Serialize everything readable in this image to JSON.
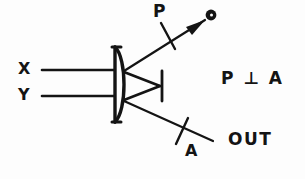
{
  "figure": {
    "background_color": "#fdfdfd",
    "ink_color": "#141414"
  },
  "labels": {
    "input_x": "X",
    "input_y": "Y",
    "polarizer": "P",
    "analyzer": "A",
    "output": "OUT",
    "relation": "P ⊥ A"
  },
  "elements": {
    "device_body_name": "lens-element",
    "detector_dot_name": "detector-dot",
    "arrowhead_name": "beam-arrowhead",
    "terminator_name": "output-terminator-bar",
    "polarizer_tick_name": "polarizer-tick",
    "analyzer_tick_name": "analyzer-tick"
  }
}
